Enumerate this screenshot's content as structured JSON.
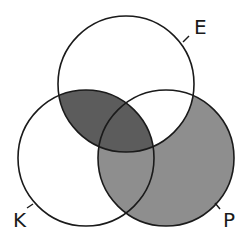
{
  "diagram": {
    "type": "venn",
    "sets": [
      {
        "id": "E",
        "label": "E",
        "cx": 126,
        "cy": 84,
        "r": 68
      },
      {
        "id": "K",
        "label": "K",
        "cx": 86,
        "cy": 158,
        "r": 68
      },
      {
        "id": "P",
        "label": "P",
        "cx": 166,
        "cy": 158,
        "r": 68
      }
    ],
    "regions": {
      "E_and_K_only": "dark",
      "E_and_K_and_P": "dark",
      "P_only": "medium",
      "K_and_P_only": "medium",
      "E_only": "none",
      "K_only": "none",
      "E_and_P_only": "none"
    },
    "colors": {
      "dark": "#5c5c5c",
      "medium": "#8e8e8e",
      "stroke": "#1a1a1a",
      "background": "#ffffff"
    }
  }
}
